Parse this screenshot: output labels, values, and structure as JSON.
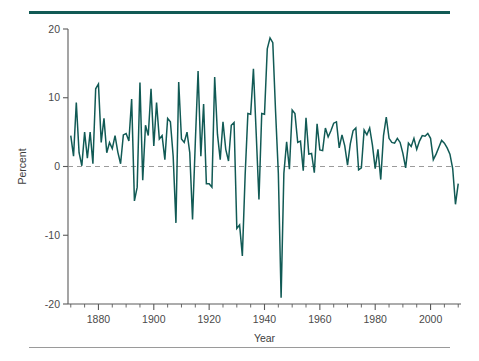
{
  "figure": {
    "top_rule_color": "#115A55",
    "bottom_rule_color": "#9A9A9A",
    "background": "#FFFFFF"
  },
  "chart_data": {
    "type": "line",
    "title": "",
    "subtitle": "",
    "xlabel": "Year",
    "ylabel": "Percent",
    "xlim": [
      1869,
      2011
    ],
    "ylim": [
      -20,
      20
    ],
    "grid": false,
    "legend": null,
    "zero_reference_line": {
      "value": 0,
      "style": "dashed",
      "color": "#9B9B9B"
    },
    "series_color": "#115A55",
    "y_ticks": [
      -20,
      -10,
      0,
      10,
      20
    ],
    "y_tick_labels": [
      "-20",
      "-10",
      "0",
      "10",
      "20"
    ],
    "x_ticks": [
      1880,
      1900,
      1920,
      1940,
      1960,
      1980,
      2000
    ],
    "x_tick_labels": [
      "1880",
      "1900",
      "1920",
      "1940",
      "1960",
      "1980",
      "2000"
    ],
    "x_minor_tick_interval": 5,
    "series": [
      {
        "name": "Percent change",
        "x": [
          1870,
          1871,
          1872,
          1873,
          1874,
          1875,
          1876,
          1877,
          1878,
          1879,
          1880,
          1881,
          1882,
          1883,
          1884,
          1885,
          1886,
          1887,
          1888,
          1889,
          1890,
          1891,
          1892,
          1893,
          1894,
          1895,
          1896,
          1897,
          1898,
          1899,
          1900,
          1901,
          1902,
          1903,
          1904,
          1905,
          1906,
          1907,
          1908,
          1909,
          1910,
          1911,
          1912,
          1913,
          1914,
          1915,
          1916,
          1917,
          1918,
          1919,
          1920,
          1921,
          1922,
          1923,
          1924,
          1925,
          1926,
          1927,
          1928,
          1929,
          1930,
          1931,
          1932,
          1933,
          1934,
          1935,
          1936,
          1937,
          1938,
          1939,
          1940,
          1941,
          1942,
          1943,
          1944,
          1945,
          1946,
          1947,
          1948,
          1949,
          1950,
          1951,
          1952,
          1953,
          1954,
          1955,
          1956,
          1957,
          1958,
          1959,
          1960,
          1961,
          1962,
          1963,
          1964,
          1965,
          1966,
          1967,
          1968,
          1969,
          1970,
          1971,
          1972,
          1973,
          1974,
          1975,
          1976,
          1977,
          1978,
          1979,
          1980,
          1981,
          1982,
          1983,
          1984,
          1985,
          1986,
          1987,
          1988,
          1989,
          1990,
          1991,
          1992,
          1993,
          1994,
          1995,
          1996,
          1997,
          1998,
          1999,
          2000,
          2001,
          2002,
          2003,
          2004,
          2005,
          2006,
          2007,
          2008,
          2009,
          2010
        ],
        "values": [
          4.5,
          1.5,
          9.3,
          2.0,
          0.1,
          5.0,
          1.2,
          5.0,
          0.4,
          11.3,
          12.0,
          3.5,
          7.0,
          2.0,
          3.5,
          2.6,
          4.5,
          2.1,
          0.4,
          4.6,
          4.8,
          3.7,
          9.8,
          -5.0,
          -3.0,
          12.2,
          -2.0,
          6.0,
          4.5,
          11.3,
          3.0,
          9.3,
          4.0,
          4.5,
          1.0,
          7.0,
          6.5,
          1.5,
          -8.2,
          12.3,
          4.0,
          3.5,
          5.0,
          2.0,
          -7.7,
          3.5,
          13.9,
          1.5,
          9.1,
          -2.5,
          -2.5,
          -3.0,
          13.0,
          4.7,
          1.0,
          6.5,
          2.5,
          0.8,
          6.0,
          6.4,
          -9.0,
          -8.5,
          -13.0,
          -1.3,
          7.7,
          7.6,
          14.2,
          4.8,
          -4.8,
          7.7,
          7.6,
          17.1,
          18.7,
          18.0,
          8.0,
          -1.0,
          -19.1,
          -1.0,
          3.6,
          -0.4,
          8.2,
          7.7,
          3.5,
          3.7,
          -0.6,
          7.1,
          1.8,
          1.9,
          -0.9,
          6.2,
          2.4,
          2.3,
          5.6,
          4.3,
          5.2,
          6.3,
          6.5,
          2.7,
          4.6,
          3.0,
          0.2,
          3.3,
          5.2,
          5.6,
          -0.5,
          -0.2,
          5.3,
          4.6,
          5.6,
          3.1,
          -0.3,
          2.5,
          -1.9,
          4.5,
          7.2,
          4.1,
          3.5,
          3.4,
          4.1,
          3.5,
          1.9,
          -0.2,
          3.4,
          2.9,
          4.1,
          2.5,
          3.7,
          4.5,
          4.4,
          4.8,
          4.1,
          1.0,
          1.8,
          2.8,
          3.8,
          3.4,
          2.7,
          1.8,
          -0.3,
          -5.5,
          -2.5
        ]
      }
    ]
  }
}
